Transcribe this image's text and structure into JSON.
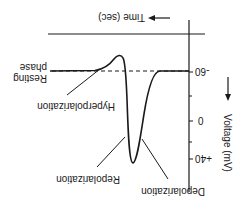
{
  "diagram": {
    "orientation": "rotated 180 degrees",
    "x_axis": {
      "label": "Time (sec)",
      "arrow": "right-arrow"
    },
    "y_axis": {
      "label": "Voltage (mV)",
      "arrow": "up-arrow",
      "ticks": [
        {
          "value": -60,
          "label": "-60"
        },
        {
          "value": 0,
          "label": "0"
        },
        {
          "value": 40,
          "label": "+40"
        }
      ]
    },
    "annotations": {
      "resting_line1": "Resting",
      "resting_line2": "phase",
      "hyperpolarization": "Hyperpolarization",
      "repolarization": "Repolarization",
      "depolarization": "Depolarization"
    },
    "colors": {
      "ink": "#1a1a1a",
      "background": "#ffffff"
    }
  }
}
